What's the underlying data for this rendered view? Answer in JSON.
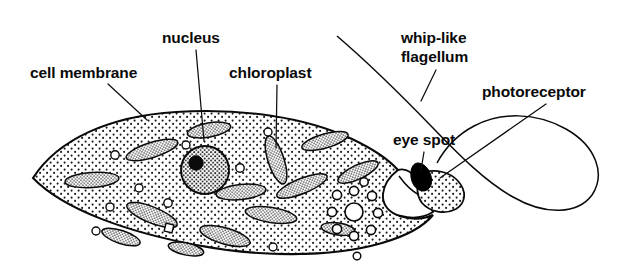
{
  "diagram": {
    "organism": "euglena",
    "background_color": "#ffffff",
    "ink_color": "#0a0a0a",
    "labels": [
      {
        "id": "cell-membrane",
        "text": "cell membrane",
        "x": 30,
        "y": 78,
        "anchor": "start",
        "leader": "M 108,84 L 147,120"
      },
      {
        "id": "nucleus",
        "text": "nucleus",
        "x": 162,
        "y": 43,
        "anchor": "start",
        "leader": "M 196,50 L 204,141"
      },
      {
        "id": "chloroplast",
        "text": "chloroplast",
        "x": 229,
        "y": 78,
        "anchor": "start",
        "leader": "M 277,85 L 276,148"
      },
      {
        "id": "whip-like-flagellum",
        "text": "whip-like",
        "text2": "flagellum",
        "x": 401,
        "y": 43,
        "anchor": "start",
        "leader": "M 436,70 L 421,101"
      },
      {
        "id": "photoreceptor",
        "text": "photoreceptor",
        "x": 482,
        "y": 97,
        "anchor": "start",
        "leader": "M 546,104 L 440,178"
      },
      {
        "id": "eye-spot",
        "text": "eye spot",
        "x": 393,
        "y": 145,
        "anchor": "start",
        "leader": "M 424,152 L 421,172"
      }
    ],
    "structures": {
      "cell_body": "lens-shaped spindle cell with stippled cytoplasm",
      "nucleus": {
        "cx": 205,
        "cy": 170,
        "r": 24,
        "nucleolus_r": 7
      },
      "contractile_vacuole": {
        "cx": 354,
        "cy": 212,
        "r": 9,
        "satellite_count": 9
      },
      "eye_spot": {
        "cx": 424,
        "cy": 172,
        "color": "#000000"
      },
      "reservoir": "open white gullet cavity at anterior right",
      "flagellum": "long whip-like loop extending right",
      "chloroplast_count": 14,
      "granule_count": 12
    }
  }
}
